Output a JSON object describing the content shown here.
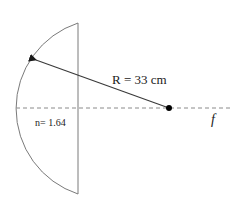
{
  "diagram": {
    "type": "optics-plano-convex-lens",
    "radius_label": "R = 33 cm",
    "index_label": "n= 1.64",
    "focal_label": "f",
    "colors": {
      "lens_outline": "#7a7a7a",
      "radius_arrow": "#3a3a3a",
      "axis_dashed": "#8a8a8a",
      "center_dot": "#000000",
      "text": "#1a1a1a"
    }
  }
}
